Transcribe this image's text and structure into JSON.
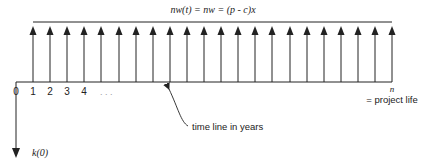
{
  "title_formula": "nw(t) = nw = (p - c)x",
  "timeline": {
    "tick_labels": [
      "0",
      "1",
      "2",
      "3",
      "4"
    ],
    "ellipsis": ". . .",
    "end_label": "n",
    "end_caption": "= project life",
    "annotation": "time line in years"
  },
  "initial_outflow_label": "k(0)",
  "arrows": {
    "count": 22,
    "first_x": 33,
    "spacing": 17.1,
    "top_y": 22,
    "base_y": 82
  },
  "colors": {
    "line": "#222222",
    "background": "#ffffff"
  }
}
